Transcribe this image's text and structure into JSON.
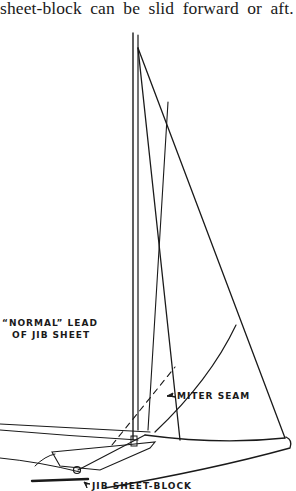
{
  "body_text": "sheet-block can be slid forward or aft.",
  "figure": {
    "labels": {
      "normal_lead_line1": "“NORMAL” LEAD",
      "normal_lead_line2": "OF JIB SHEET",
      "miter_seam": "MITER SEAM",
      "jib_sheet_block": "JIB SHEET-BLOCK"
    },
    "colors": {
      "ink": "#1a1a1a",
      "paper": "#ffffff"
    }
  }
}
